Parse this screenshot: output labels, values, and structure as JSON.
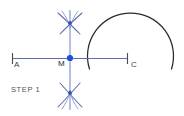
{
  "figure": {
    "title_text": "STEP 1",
    "background_color": "#ffffff",
    "line_color": "#5b6fae",
    "arc_color": "#3b4a8c",
    "circle_color": "#2b2b2b",
    "point_color": "#1d4fd8",
    "label_color": "#3f3f46",
    "labels": {
      "a": "A",
      "m": "M",
      "c": "C",
      "step": "STEP 1"
    },
    "geometry": {
      "segment_start_x": 12,
      "segment_end_x": 128,
      "segment_y": 58,
      "midpoint_x": 70,
      "midpoint_y": 58,
      "vertical_top_y": 10,
      "vertical_bottom_y": 110,
      "upper_cross_y": 23,
      "lower_cross_y": 93,
      "circle_center_x": 130,
      "circle_center_y": 57,
      "circle_radius": 43
    }
  }
}
